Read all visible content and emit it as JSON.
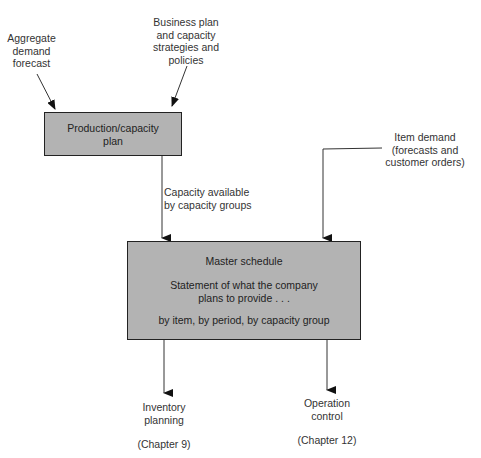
{
  "inputs": {
    "aggregate_demand": {
      "lines": [
        "Aggregate",
        "demand",
        "forecast"
      ]
    },
    "business_plan": {
      "lines": [
        "Business plan",
        "and capacity",
        "strategies and",
        "policies"
      ]
    },
    "item_demand": {
      "lines": [
        "Item demand",
        "(forecasts and",
        "customer orders)"
      ]
    }
  },
  "production_box": {
    "lines": [
      "Production/capacity",
      "plan"
    ]
  },
  "capacity_label": {
    "lines": [
      "Capacity available",
      "by capacity groups"
    ]
  },
  "master_box": {
    "title": "Master schedule",
    "statement": [
      "Statement of what the company",
      "plans to provide . . ."
    ],
    "detail": "by item, by period, by capacity group"
  },
  "outputs": {
    "inventory": {
      "lines": [
        "Inventory",
        "planning"
      ],
      "chapter": "(Chapter  9)"
    },
    "operation": {
      "lines": [
        "Operation",
        "control"
      ],
      "chapter": "(Chapter 12)"
    }
  },
  "colors": {
    "box_fill": "#b3b3b3",
    "line": "#333333"
  }
}
